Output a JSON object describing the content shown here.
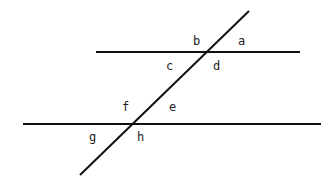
{
  "diagram": {
    "type": "parallel-lines-cut-by-transversal",
    "lines": {
      "top_parallel": {
        "x1": 96,
        "y1": 52,
        "x2": 300,
        "y2": 52
      },
      "bottom_parallel": {
        "x1": 23,
        "y1": 124,
        "x2": 321,
        "y2": 124
      },
      "transversal": {
        "x1": 249,
        "y1": 11,
        "x2": 80,
        "y2": 175
      }
    },
    "labels": {
      "a": {
        "text": "a",
        "x": 238,
        "y": 45
      },
      "b": {
        "text": "b",
        "x": 193,
        "y": 45
      },
      "c": {
        "text": "c",
        "x": 166,
        "y": 70
      },
      "d": {
        "text": "d",
        "x": 213,
        "y": 70
      },
      "e": {
        "text": "e",
        "x": 169,
        "y": 111
      },
      "f": {
        "text": "f",
        "x": 122,
        "y": 111
      },
      "g": {
        "text": "g",
        "x": 89,
        "y": 141
      },
      "h": {
        "text": "h",
        "x": 137,
        "y": 141
      }
    },
    "colors": {
      "line": "#111111",
      "label": "#222222",
      "background": "#ffffff"
    }
  }
}
